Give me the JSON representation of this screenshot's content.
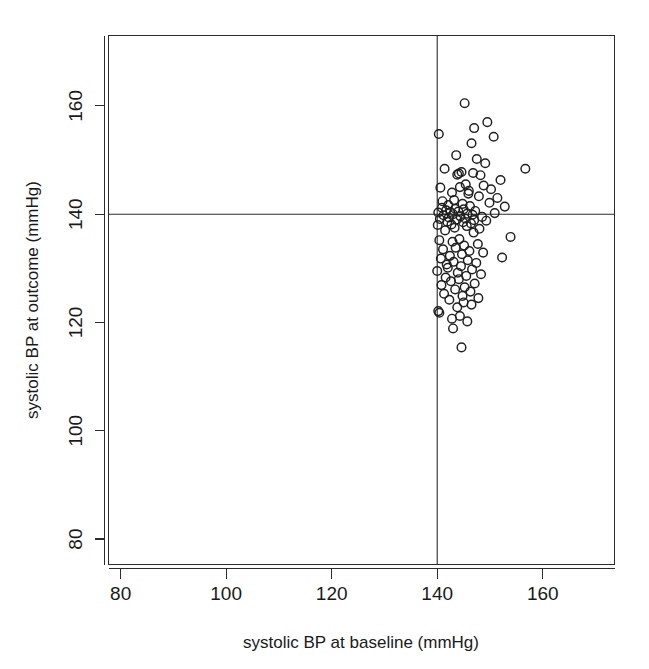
{
  "chart_data": {
    "type": "scatter",
    "title": "",
    "xlabel": "systolic BP at baseline (mmHg)",
    "ylabel": "systolic BP at outcome (mmHg)",
    "xlim": [
      77.7,
      173.6
    ],
    "ylim": [
      75.3,
      173.0
    ],
    "xticks": [
      80,
      100,
      120,
      140,
      160
    ],
    "yticks": [
      80,
      100,
      120,
      140,
      160
    ],
    "xticklabels": [
      "80",
      "100",
      "120",
      "140",
      "160"
    ],
    "yticklabels": [
      "80",
      "100",
      "120",
      "140",
      "160"
    ],
    "grid": false,
    "legend": null,
    "marker": "open-circle",
    "marker_color": "#1f1f1f",
    "marker_radius_px": 4.3,
    "reference_lines": [
      {
        "orientation": "vertical",
        "value": 140,
        "label": "baseline threshold 140 mmHg"
      },
      {
        "orientation": "horizontal",
        "value": 140,
        "label": "outcome threshold 140 mmHg"
      }
    ],
    "n_points": 112,
    "points": [
      [
        145.2,
        160.5
      ],
      [
        149.5,
        157.0
      ],
      [
        147.0,
        155.9
      ],
      [
        140.3,
        154.8
      ],
      [
        150.7,
        154.3
      ],
      [
        146.5,
        153.1
      ],
      [
        143.6,
        150.9
      ],
      [
        147.5,
        150.2
      ],
      [
        149.1,
        149.4
      ],
      [
        141.4,
        148.4
      ],
      [
        156.7,
        148.4
      ],
      [
        144.6,
        147.8
      ],
      [
        146.8,
        147.6
      ],
      [
        144.1,
        147.5
      ],
      [
        143.8,
        147.3
      ],
      [
        148.2,
        147.2
      ],
      [
        152.0,
        146.3
      ],
      [
        145.4,
        145.5
      ],
      [
        148.8,
        145.3
      ],
      [
        144.3,
        145.0
      ],
      [
        140.6,
        144.9
      ],
      [
        150.2,
        144.6
      ],
      [
        146.0,
        144.3
      ],
      [
        142.8,
        144.0
      ],
      [
        145.9,
        143.8
      ],
      [
        147.9,
        143.3
      ],
      [
        151.4,
        143.0
      ],
      [
        143.2,
        142.6
      ],
      [
        141.0,
        142.4
      ],
      [
        149.9,
        142.1
      ],
      [
        144.8,
        141.9
      ],
      [
        142.1,
        141.7
      ],
      [
        146.2,
        141.5
      ],
      [
        152.8,
        141.4
      ],
      [
        140.9,
        141.2
      ],
      [
        143.4,
        141.0
      ],
      [
        145.0,
        140.9
      ],
      [
        141.7,
        140.7
      ],
      [
        147.2,
        140.6
      ],
      [
        144.0,
        140.5
      ],
      [
        142.5,
        140.4
      ],
      [
        140.2,
        140.3
      ],
      [
        150.9,
        140.2
      ],
      [
        145.7,
        140.1
      ],
      [
        143.0,
        140.0
      ],
      [
        146.7,
        139.9
      ],
      [
        141.2,
        139.8
      ],
      [
        144.4,
        139.6
      ],
      [
        148.5,
        139.5
      ],
      [
        142.2,
        139.4
      ],
      [
        145.3,
        139.2
      ],
      [
        140.5,
        139.1
      ],
      [
        143.7,
        139.0
      ],
      [
        147.0,
        138.9
      ],
      [
        149.3,
        138.8
      ],
      [
        141.9,
        138.6
      ],
      [
        144.9,
        138.5
      ],
      [
        146.4,
        138.3
      ],
      [
        142.7,
        138.1
      ],
      [
        140.1,
        138.0
      ],
      [
        145.6,
        137.8
      ],
      [
        143.3,
        137.5
      ],
      [
        148.0,
        137.3
      ],
      [
        141.5,
        137.0
      ],
      [
        146.9,
        136.6
      ],
      [
        153.9,
        135.8
      ],
      [
        144.2,
        135.4
      ],
      [
        140.4,
        135.2
      ],
      [
        142.9,
        134.9
      ],
      [
        147.7,
        134.5
      ],
      [
        145.1,
        134.2
      ],
      [
        143.5,
        133.8
      ],
      [
        141.1,
        133.5
      ],
      [
        146.1,
        133.2
      ],
      [
        148.7,
        132.9
      ],
      [
        144.7,
        132.6
      ],
      [
        142.4,
        132.3
      ],
      [
        152.3,
        132.0
      ],
      [
        140.7,
        131.8
      ],
      [
        145.8,
        131.5
      ],
      [
        143.1,
        131.2
      ],
      [
        147.4,
        131.0
      ],
      [
        141.8,
        130.7
      ],
      [
        144.5,
        130.4
      ],
      [
        142.0,
        130.1
      ],
      [
        146.6,
        129.8
      ],
      [
        140.0,
        129.5
      ],
      [
        143.9,
        129.2
      ],
      [
        148.3,
        128.9
      ],
      [
        145.5,
        128.6
      ],
      [
        141.6,
        128.3
      ],
      [
        144.1,
        128.0
      ],
      [
        142.6,
        127.6
      ],
      [
        147.1,
        127.2
      ],
      [
        140.8,
        126.9
      ],
      [
        145.2,
        126.5
      ],
      [
        143.4,
        126.1
      ],
      [
        146.3,
        125.7
      ],
      [
        141.3,
        125.3
      ],
      [
        144.8,
        124.9
      ],
      [
        147.8,
        124.5
      ],
      [
        142.3,
        124.2
      ],
      [
        145.0,
        123.7
      ],
      [
        146.5,
        123.3
      ],
      [
        143.8,
        122.8
      ],
      [
        140.2,
        122.1
      ],
      [
        140.4,
        121.8
      ],
      [
        144.3,
        121.2
      ],
      [
        142.8,
        120.7
      ],
      [
        145.7,
        120.2
      ],
      [
        143.0,
        118.9
      ],
      [
        144.6,
        115.4
      ]
    ]
  }
}
